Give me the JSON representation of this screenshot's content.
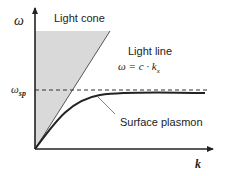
{
  "diagram": {
    "y_axis_label": "ω",
    "x_axis_label": "k",
    "omega_sp_label": {
      "main": "ω",
      "sub": "sp"
    },
    "light_cone_label": "Light cone",
    "light_line_label": "Light line",
    "light_line_eq": {
      "lhs": "ω = c · k",
      "sub": "x"
    },
    "surface_plasmon_label": "Surface plasmon",
    "colors": {
      "axis": "#222222",
      "cone_fill": "#d9d9d9",
      "light_line": "#555555",
      "curve": "#222222",
      "dashed": "#333333",
      "pointer": "#666666"
    }
  }
}
